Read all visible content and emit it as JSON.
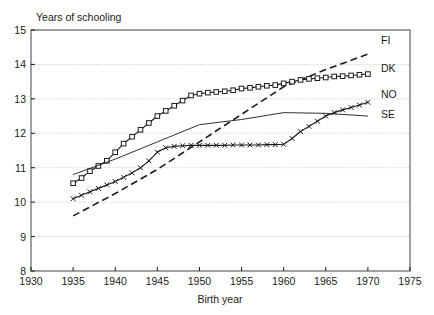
{
  "chart_data": {
    "type": "line",
    "title": "",
    "ylabel": "Years of schooling",
    "xlabel": "Birth year",
    "xlim": [
      1930,
      1975
    ],
    "ylim": [
      8,
      15
    ],
    "xticks": [
      1930,
      1935,
      1940,
      1945,
      1950,
      1955,
      1960,
      1965,
      1970,
      1975
    ],
    "yticks": [
      8,
      9,
      10,
      11,
      12,
      13,
      14,
      15
    ],
    "grid": "horizontal-dotted",
    "legend_position": "right-inline",
    "series": [
      {
        "name": "FI",
        "label": "FI",
        "style": "dashed",
        "marker": "none",
        "x": [
          1935,
          1940,
          1945,
          1950,
          1955,
          1960,
          1965,
          1970
        ],
        "values": [
          9.6,
          10.25,
          10.95,
          11.75,
          12.55,
          13.35,
          13.85,
          14.3
        ]
      },
      {
        "name": "DK",
        "label": "DK",
        "style": "solid",
        "marker": "square",
        "x": [
          1935,
          1936,
          1937,
          1938,
          1939,
          1940,
          1941,
          1942,
          1943,
          1944,
          1945,
          1946,
          1947,
          1948,
          1949,
          1950,
          1951,
          1952,
          1953,
          1954,
          1955,
          1956,
          1957,
          1958,
          1959,
          1960,
          1961,
          1962,
          1963,
          1964,
          1965,
          1966,
          1967,
          1968,
          1969,
          1970
        ],
        "values": [
          10.55,
          10.7,
          10.9,
          11.05,
          11.2,
          11.45,
          11.7,
          11.9,
          12.1,
          12.3,
          12.5,
          12.65,
          12.8,
          12.95,
          13.1,
          13.15,
          13.18,
          13.2,
          13.22,
          13.25,
          13.3,
          13.32,
          13.35,
          13.38,
          13.4,
          13.45,
          13.5,
          13.55,
          13.58,
          13.6,
          13.62,
          13.65,
          13.66,
          13.68,
          13.7,
          13.72
        ]
      },
      {
        "name": "NO",
        "label": "NO",
        "style": "solid-thin",
        "marker": "none",
        "x": [
          1935,
          1940,
          1945,
          1950,
          1955,
          1960,
          1965,
          1970
        ],
        "values": [
          10.8,
          11.25,
          11.75,
          12.25,
          12.4,
          12.6,
          12.58,
          12.5
        ]
      },
      {
        "name": "SE",
        "label": "SE",
        "style": "solid",
        "marker": "x",
        "x": [
          1935,
          1936,
          1937,
          1938,
          1939,
          1940,
          1941,
          1942,
          1943,
          1944,
          1945,
          1946,
          1947,
          1948,
          1949,
          1950,
          1951,
          1952,
          1953,
          1954,
          1955,
          1956,
          1957,
          1958,
          1959,
          1960,
          1961,
          1962,
          1963,
          1964,
          1965,
          1966,
          1967,
          1968,
          1969,
          1970
        ],
        "values": [
          10.1,
          10.2,
          10.3,
          10.4,
          10.5,
          10.6,
          10.72,
          10.85,
          11.0,
          11.2,
          11.45,
          11.58,
          11.62,
          11.64,
          11.65,
          11.65,
          11.65,
          11.65,
          11.65,
          11.66,
          11.66,
          11.66,
          11.66,
          11.67,
          11.67,
          11.68,
          11.85,
          12.05,
          12.2,
          12.35,
          12.5,
          12.6,
          12.68,
          12.75,
          12.82,
          12.9
        ]
      }
    ]
  },
  "labels": {
    "ylabel": "Years of schooling",
    "xlabel": "Birth year"
  }
}
